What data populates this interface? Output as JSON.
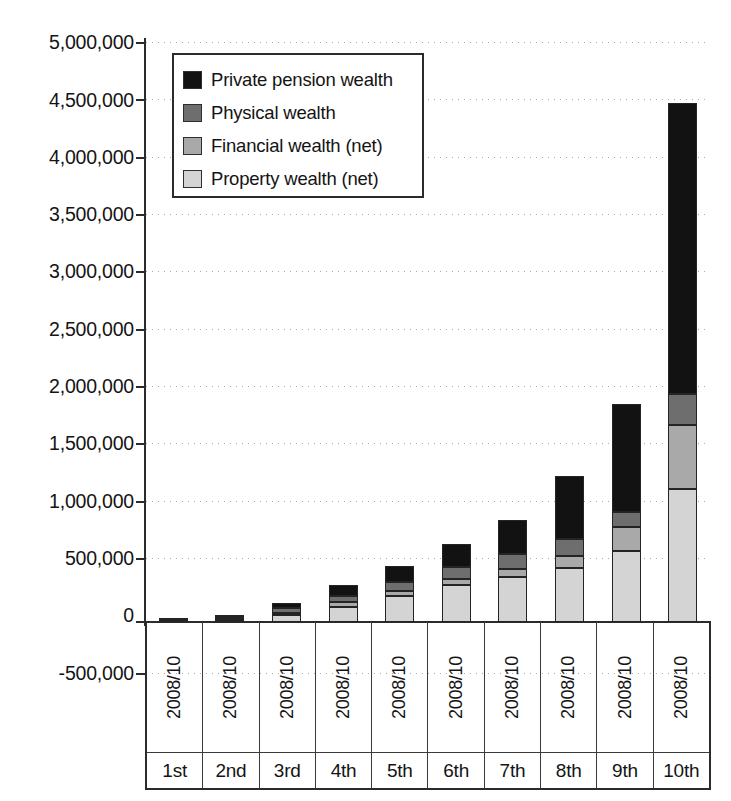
{
  "chart_data": {
    "type": "bar",
    "subtype": "stacked",
    "title": "",
    "xlabel": "",
    "ylabel": "",
    "grid": true,
    "legend_position": "top-left",
    "ylim": [
      -500000,
      5000000
    ],
    "ytick_step": 500000,
    "ytick_labels": [
      "5,000,000",
      "4,500,000",
      "4,000,000",
      "3,500,000",
      "3,000,000",
      "2,500,000",
      "2,000,000",
      "1,500,000",
      "1,000,000",
      "500,000",
      "0",
      "-500,000"
    ],
    "ytick_values": [
      5000000,
      4500000,
      4000000,
      3500000,
      3000000,
      2500000,
      2000000,
      1500000,
      1000000,
      500000,
      0,
      -500000
    ],
    "categories": [
      "1st",
      "2nd",
      "3rd",
      "4th",
      "5th",
      "6th",
      "7th",
      "8th",
      "9th",
      "10th"
    ],
    "period_labels": [
      "2008/10",
      "2008/10",
      "2008/10",
      "2008/10",
      "2008/10",
      "2008/10",
      "2008/10",
      "2008/10",
      "2008/10",
      "2008/10"
    ],
    "series": [
      {
        "name": "Property wealth (net)",
        "color": "#d4d4d4",
        "values": [
          4000,
          20000,
          62000,
          130000,
          222000,
          320000,
          392000,
          470000,
          610000,
          1150000
        ]
      },
      {
        "name": "Financial wealth (net)",
        "color": "#a9a9a9",
        "values": [
          3000,
          9000,
          20000,
          40000,
          45000,
          55000,
          62000,
          100000,
          210000,
          550000
        ]
      },
      {
        "name": "Physical wealth",
        "color": "#6e6e6e",
        "values": [
          8000,
          18000,
          40000,
          55000,
          75000,
          100000,
          130000,
          148000,
          130000,
          270000
        ]
      },
      {
        "name": "Private pension wealth",
        "color": "#121212",
        "values": [
          5000,
          8000,
          38000,
          95000,
          138000,
          195000,
          296000,
          542000,
          930000,
          2510000
        ]
      }
    ],
    "totals": [
      20000,
      55000,
      160000,
      320000,
      480000,
      670000,
      880000,
      1260000,
      1880000,
      4480000
    ]
  },
  "legend": {
    "items": [
      {
        "label": "Private pension wealth",
        "swatch": "sw-pension"
      },
      {
        "label": "Physical wealth",
        "swatch": "sw-physical"
      },
      {
        "label": "Financial wealth (net)",
        "swatch": "sw-financial"
      },
      {
        "label": "Property wealth (net)",
        "swatch": "sw-property"
      }
    ]
  }
}
